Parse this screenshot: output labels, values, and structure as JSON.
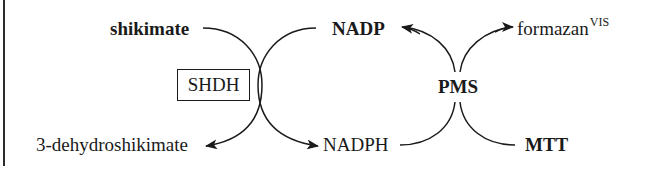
{
  "diagram": {
    "type": "coupled-reaction-scheme",
    "left_reaction": {
      "enzyme": "SHDH",
      "substrate": "shikimate",
      "product": "3-dehydroshikimate",
      "cofactor_in": "NADP",
      "cofactor_out": "NADPH"
    },
    "right_reaction": {
      "mediator": "PMS",
      "electron_donor": "NADPH",
      "oxidized_product": "NADP",
      "dye_in": "MTT",
      "dye_out": "formazan",
      "dye_out_superscript": "VIS"
    },
    "labels": {
      "shikimate": "shikimate",
      "dehydroshikimate": "3-dehydroshikimate",
      "shdh": "SHDH",
      "nadp": "NADP",
      "nadph": "NADPH",
      "pms": "PMS",
      "formazan": "formazan",
      "formazan_sup": "VIS",
      "mtt": "MTT"
    },
    "colors": {
      "ink": "#1a1a1a",
      "background": "#ffffff"
    }
  }
}
